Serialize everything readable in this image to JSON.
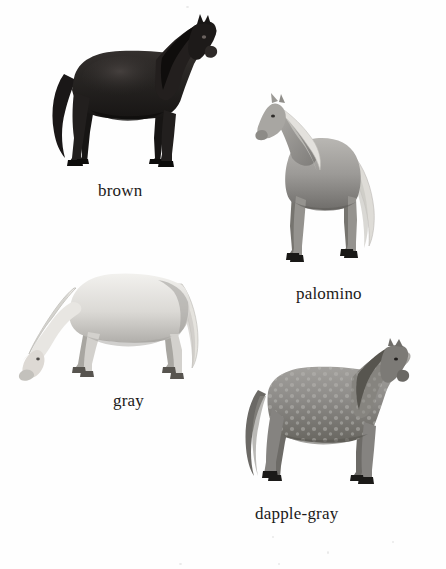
{
  "plate": {
    "background_color": "#fefefe",
    "text_color": "#1c1a19",
    "title": "",
    "figures": [
      {
        "id": "brown",
        "caption": "brown",
        "coat_color": "#2b2826",
        "shade_color": "#141211",
        "highlight_color": "#4a4543",
        "pose": "standing, facing right, head raised",
        "mane_color": "#121010",
        "tail_color": "#1a1717",
        "hoof_color": "#0e0d0c"
      },
      {
        "id": "palomino",
        "caption": "palomino",
        "coat_color": "#9c9a97",
        "shade_color": "#6f6d6a",
        "highlight_color": "#cfcdc9",
        "pose": "standing, facing left, head raised",
        "mane_color": "#e3e1dd",
        "tail_color": "#dedcd7",
        "hoof_color": "#191816"
      },
      {
        "id": "gray",
        "caption": "gray",
        "coat_color": "#d7d5d1",
        "shade_color": "#a7a5a1",
        "highlight_color": "#f2f1ee",
        "pose": "grazing, head lowered, facing left",
        "mane_color": "#ebe9e5",
        "tail_color": "#e5e3de",
        "hoof_color": "#4a4744"
      },
      {
        "id": "dapple-gray",
        "coat_color": "#8e8c89",
        "caption": "dapple-gray",
        "shade_color": "#63615e",
        "highlight_color": "#b6b4b0",
        "pose": "standing, facing right, head lowered slightly",
        "mane_color": "#57554f",
        "tail_color": "#6b6965",
        "hoof_color": "#1b1a18",
        "pattern": "dappled"
      }
    ]
  }
}
